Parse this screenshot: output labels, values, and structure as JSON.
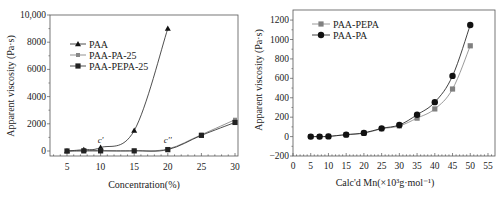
{
  "chart_data": [
    {
      "type": "line",
      "title": "",
      "xlabel": "Concentration(%)",
      "ylabel": "Apparent viscosity (Pa·s)",
      "xlim": [
        3,
        32
      ],
      "ylim": [
        -500,
        10000
      ],
      "xticks": [
        5,
        10,
        15,
        20,
        25,
        30
      ],
      "yticks": [
        0,
        2000,
        4000,
        6000,
        8000,
        10000
      ],
      "ytick_labels": [
        "0",
        "2000",
        "4000",
        "6000",
        "8000",
        "10,000"
      ],
      "legend_position": "upper-left",
      "annotations": [
        {
          "text": "c'",
          "x": 10,
          "y": 450
        },
        {
          "text": "c''",
          "x": 20,
          "y": 450
        }
      ],
      "series": [
        {
          "name": "PAA",
          "marker": "triangle",
          "x": [
            5,
            7.5,
            10,
            15,
            20
          ],
          "values": [
            0,
            100,
            250,
            1500,
            9000
          ]
        },
        {
          "name": "PAA-PA-25",
          "marker": "square-small",
          "x": [
            5,
            7.5,
            10,
            15,
            20,
            25,
            30
          ],
          "values": [
            0,
            20,
            20,
            20,
            150,
            1200,
            2300
          ]
        },
        {
          "name": "PAA-PEPA-25",
          "marker": "square",
          "x": [
            5,
            7.5,
            10,
            15,
            20,
            25,
            30
          ],
          "values": [
            0,
            10,
            10,
            10,
            100,
            1150,
            2100
          ]
        }
      ]
    },
    {
      "type": "line",
      "title": "",
      "xlabel": "Calc'd Mn(×10³g·mol⁻¹)",
      "ylabel": "Apparent viscosity (Pa·s)",
      "xlim": [
        0,
        55
      ],
      "ylim": [
        -200,
        1300
      ],
      "xticks": [
        0,
        5,
        10,
        15,
        20,
        25,
        30,
        35,
        40,
        45,
        50,
        55
      ],
      "yticks": [
        -200,
        0,
        200,
        400,
        600,
        800,
        1000,
        1200
      ],
      "legend_position": "upper-left",
      "series": [
        {
          "name": "PAA-PEPA",
          "marker": "square",
          "color": "#808080",
          "x": [
            5,
            7.5,
            10,
            15,
            20,
            25,
            30,
            35,
            40,
            45,
            50
          ],
          "values": [
            0,
            0,
            2,
            20,
            35,
            80,
            110,
            190,
            285,
            490,
            935
          ]
        },
        {
          "name": "PAA-PA",
          "marker": "circle",
          "color": "#111111",
          "x": [
            5,
            7.5,
            10,
            15,
            20,
            25,
            30,
            35,
            40,
            45,
            50
          ],
          "values": [
            0,
            0,
            2,
            20,
            38,
            85,
            120,
            225,
            355,
            625,
            1150
          ]
        }
      ]
    }
  ]
}
